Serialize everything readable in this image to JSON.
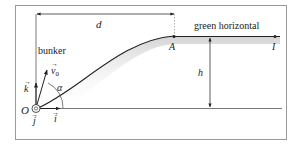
{
  "diagram": {
    "labels": {
      "distance": "d",
      "bunker": "bunker",
      "green": "green horizontal",
      "point_a": "A",
      "point_i": "I",
      "height": "h",
      "origin": "O",
      "velocity": "v",
      "velocity_sub": "0",
      "angle": "α",
      "unit_i": "i",
      "unit_j": "j",
      "unit_k": "k"
    },
    "colors": {
      "line": "#222222",
      "frame": "#9a9a9a",
      "shade": "#d8d8d8"
    }
  }
}
